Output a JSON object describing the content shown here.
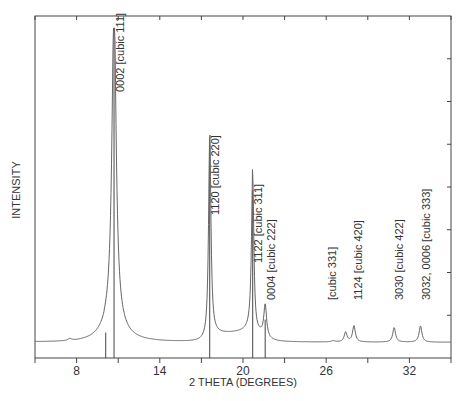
{
  "chart_data": {
    "type": "line",
    "title": "",
    "xlabel": "2 THETA (DEGREES)",
    "ylabel": "INTENSITY",
    "xlim": [
      5,
      35
    ],
    "ylim": [
      0,
      100
    ],
    "x_ticks": [
      8,
      14,
      20,
      26,
      32
    ],
    "x_minor_tick_step": 3,
    "y_ticks_labeled": false,
    "grid": false,
    "legend": null,
    "baseline_intensity": 3,
    "reference_lines": [
      {
        "x": 10.1,
        "height": 6
      },
      {
        "x": 10.7,
        "height": 100
      },
      {
        "x": 17.6,
        "height": 64
      },
      {
        "x": 20.7,
        "height": 50
      },
      {
        "x": 21.6,
        "height": 10
      }
    ],
    "peaks": [
      {
        "x": 10.7,
        "intensity": 100,
        "label": "0002  [cubic 111]",
        "width": 0.18
      },
      {
        "x": 17.6,
        "intensity": 64,
        "label": "1120  [cubic 220]",
        "width": 0.1
      },
      {
        "x": 20.7,
        "intensity": 50,
        "label": "1122  [cubic 311]",
        "width": 0.1
      },
      {
        "x": 21.6,
        "intensity": 10,
        "label": "0004  [cubic 222]",
        "width": 0.12
      },
      {
        "x": 27.4,
        "intensity": 3,
        "label": "[cubic 331]",
        "width": 0.12
      },
      {
        "x": 28.0,
        "intensity": 5,
        "label": "1124  [cubic 420]",
        "width": 0.12
      },
      {
        "x": 30.9,
        "intensity": 4.5,
        "label": "3030  [cubic 422]",
        "width": 0.12
      },
      {
        "x": 32.8,
        "intensity": 5,
        "label": "3032, 0006  [cubic 333]",
        "width": 0.12
      }
    ],
    "minor_bumps": [
      {
        "x": 7.5,
        "intensity": 0.6
      },
      {
        "x": 26.5,
        "intensity": 0.4
      }
    ]
  },
  "colors": {
    "line": "#666666",
    "axis": "#444444",
    "text": "#333333"
  }
}
